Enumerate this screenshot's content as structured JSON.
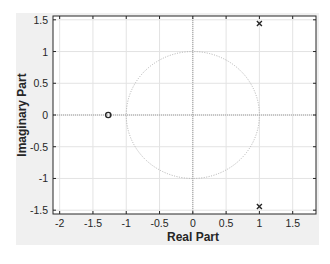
{
  "chart_data": {
    "type": "scatter",
    "subtype": "pole-zero map",
    "title": "",
    "xlabel": "Real Part",
    "ylabel": "Imaginary Part",
    "xlim": [
      -2.1,
      1.85
    ],
    "ylim": [
      -1.56,
      1.56
    ],
    "grid": true,
    "xticks": [
      -2,
      -1.5,
      -1,
      -0.5,
      0,
      0.5,
      1,
      1.5
    ],
    "xtick_labels": [
      "-2",
      "-1.5",
      "-1",
      "-0.5",
      "0",
      "0.5",
      "1",
      "1.5"
    ],
    "yticks": [
      1.5,
      1,
      0.5,
      0,
      -0.5,
      -1,
      -1.5
    ],
    "ytick_labels": [
      "1.5",
      "1",
      "0.5",
      "0",
      "-0.5",
      "-1",
      "-1.5"
    ],
    "series": [
      {
        "name": "poles",
        "marker": "x",
        "points": [
          [
            1.0,
            1.44
          ],
          [
            1.0,
            -1.44
          ]
        ]
      },
      {
        "name": "zeros",
        "marker": "o",
        "points": [
          [
            -1.27,
            0
          ]
        ]
      }
    ],
    "annotations": [
      {
        "type": "unit-circle",
        "style": "dotted",
        "center": [
          0,
          0
        ],
        "radius": 1
      }
    ],
    "colors": {
      "figure_background": "#f0f0f0",
      "axes_background": "#ffffff",
      "grid": "#e3e3e3",
      "axis_box": "#262626",
      "marker": "#262626",
      "unit_circle": "#b0b0b0",
      "zero_lines": "#9a9a9a"
    }
  }
}
